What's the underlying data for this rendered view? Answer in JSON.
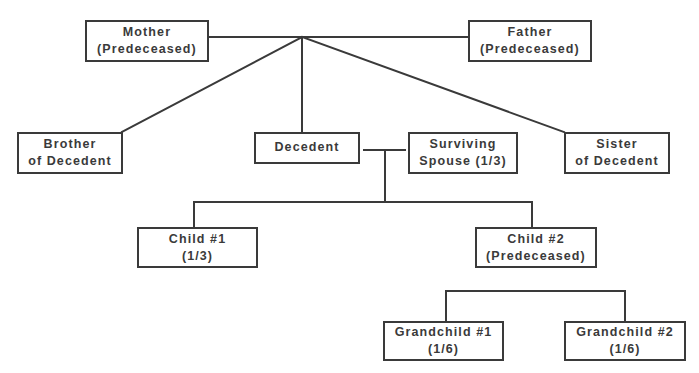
{
  "diagram": {
    "type": "family-tree-intestate-succession",
    "colors": {
      "line": "#3a3a3a",
      "text": "#3a3a3a",
      "background": "#ffffff"
    },
    "nodes": {
      "mother": {
        "line1": "Mother",
        "line2": "(Predeceased)"
      },
      "father": {
        "line1": "Father",
        "line2": "(Predeceased)"
      },
      "brother": {
        "line1": "Brother",
        "line2": "of Decedent"
      },
      "decedent": {
        "line1": "Decedent"
      },
      "spouse": {
        "line1": "Surviving",
        "line2": "Spouse (1/3)"
      },
      "sister": {
        "line1": "Sister",
        "line2": "of Decedent"
      },
      "child1": {
        "line1": "Child #1",
        "line2": "(1/3)"
      },
      "child2": {
        "line1": "Child #2",
        "line2": "(Predeceased)"
      },
      "grandchild1": {
        "line1": "Grandchild #1",
        "line2": "(1/6)"
      },
      "grandchild2": {
        "line1": "Grandchild #2",
        "line2": "(1/6)"
      }
    }
  }
}
